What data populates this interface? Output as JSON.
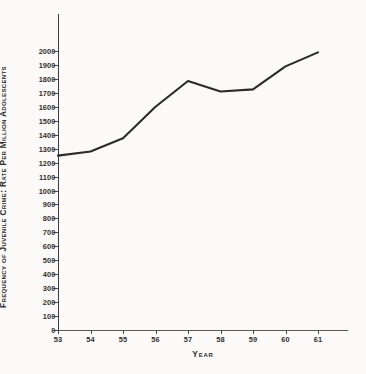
{
  "figure": {
    "background_color": "#fbfaf8",
    "line_color": "#2b2b2b"
  },
  "chart_data": {
    "type": "line",
    "title": "",
    "xlabel": "Year",
    "ylabel": "Frequency of Juvenile Crime: Rate Per Million Adolescents",
    "categories": [
      "53",
      "54",
      "55",
      "56",
      "57",
      "58",
      "59",
      "60",
      "61"
    ],
    "x": [
      53,
      54,
      55,
      56,
      57,
      58,
      59,
      60,
      61
    ],
    "values": [
      1250,
      1280,
      1375,
      1600,
      1785,
      1710,
      1725,
      1890,
      1990
    ],
    "series": [
      {
        "name": "Juvenile crime rate",
        "values": [
          1250,
          1280,
          1375,
          1600,
          1785,
          1710,
          1725,
          1890,
          1990
        ]
      }
    ],
    "ylim": [
      0,
      2000
    ],
    "ytick_step": 100,
    "yticks": [
      0,
      100,
      200,
      300,
      400,
      500,
      600,
      700,
      800,
      900,
      1000,
      1100,
      1200,
      1300,
      1400,
      1500,
      1600,
      1700,
      1800,
      1900,
      2000
    ],
    "ytick_labels": [
      "0",
      "100",
      "200",
      "300",
      "400",
      "500",
      "600",
      "700",
      "800",
      "900",
      "1000",
      "1100",
      "1200",
      "1300",
      "1400",
      "1500",
      "1600",
      "1700",
      "1800",
      "1900",
      "2000"
    ],
    "xtick_labels": [
      "53",
      "54",
      "55",
      "56",
      "57",
      "58",
      "59",
      "60",
      "61"
    ],
    "grid": false,
    "legend": false,
    "legend_position": "none",
    "marker": "none",
    "annotations": []
  }
}
